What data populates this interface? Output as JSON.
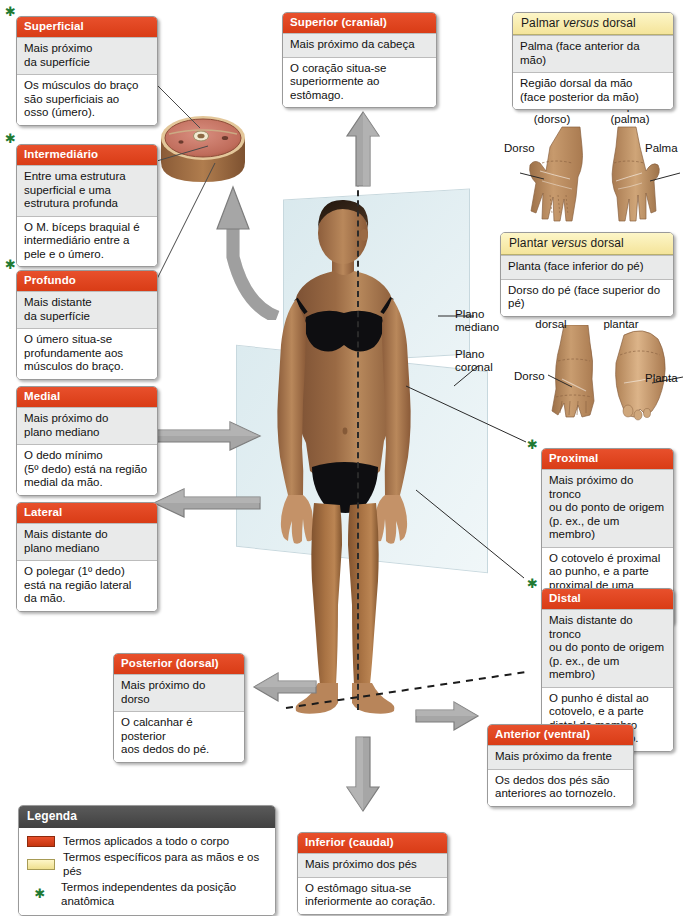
{
  "meta": {
    "colors": {
      "whole_body_term": "#e0431f",
      "hand_foot_term": "#faeeb2",
      "legend_header": "#4d4d4d",
      "star_green": "#1f7a33",
      "plane_blue": "#c4dbe2",
      "arrow_gray": "#9a9a9a"
    }
  },
  "boxes": {
    "superficial": {
      "title": "Superficial",
      "definition": "Mais próximo\nda superfície",
      "example": "Os músculos do braço\nsão superficiais ao\nosso (úmero).",
      "star": true,
      "kind": "whole-body"
    },
    "intermediario": {
      "title": "Intermediário",
      "definition": "Entre uma estrutura\nsuperficial e uma\nestrutura profunda",
      "example": "O M. bíceps braquial é\nintermediário entre a\npele e o úmero.",
      "star": true,
      "kind": "whole-body"
    },
    "profundo": {
      "title": "Profundo",
      "definition": "Mais distante\nda superfície",
      "example": "O úmero situa-se\nprofundamente aos\nmúsculos do braço.",
      "star": true,
      "kind": "whole-body"
    },
    "medial": {
      "title": "Medial",
      "definition": "Mais próximo do\nplano mediano",
      "example": "O dedo mínimo\n(5º dedo) está na região\nmedial da mão.",
      "star": false,
      "kind": "whole-body"
    },
    "lateral": {
      "title": "Lateral",
      "definition": "Mais distante do\nplano mediano",
      "example": "O polegar (1º dedo)\nestá na região lateral\nda mão.",
      "star": false,
      "kind": "whole-body"
    },
    "superior": {
      "title": "Superior (cranial)",
      "definition": "Mais próximo da cabeça",
      "example": "O coração situa-se\nsuperiormente ao estômago.",
      "star": false,
      "kind": "whole-body"
    },
    "inferior": {
      "title": "Inferior (caudal)",
      "definition": "Mais próximo dos pés",
      "example": "O estômago situa-se\ninferiormente ao coração.",
      "star": false,
      "kind": "whole-body"
    },
    "posterior": {
      "title": "Posterior (dorsal)",
      "definition": "Mais próximo do dorso",
      "example": "O calcanhar é posterior\naos dedos do pé.",
      "star": false,
      "kind": "whole-body"
    },
    "anterior": {
      "title": "Anterior (ventral)",
      "definition": "Mais próximo da frente",
      "example": "Os dedos dos pés são\nanteriores ao tornozelo.",
      "star": false,
      "kind": "whole-body"
    },
    "proximal": {
      "title": "Proximal",
      "definition": "Mais próximo do tronco\nou do ponto de origem\n(p. ex., de um membro)",
      "example": "O cotovelo é proximal\nao punho, e a parte\nproximal de uma artéria\né seu início.",
      "star": true,
      "kind": "whole-body"
    },
    "distal": {
      "title": "Distal",
      "definition": "Mais distante do tronco\nou do ponto de origem\n(p. ex., de um membro)",
      "example": "O punho é distal ao\ncotovelo, e a parte\ndistal do membro\nsuperior é a mão.",
      "star": true,
      "kind": "whole-body"
    },
    "palmar": {
      "title_pre": "Palmar ",
      "title_em": "versus",
      "title_post": " dorsal",
      "row1": "Palma (face anterior da mão)",
      "row2": "Região dorsal da mão\n(face posterior da mão)",
      "kind": "hand-foot"
    },
    "plantar": {
      "title_pre": "Plantar ",
      "title_em": "versus",
      "title_post": " dorsal",
      "row1": "Planta (face inferior do pé)",
      "row2": "Dorso do pé (face superior do pé)",
      "kind": "hand-foot"
    }
  },
  "legend": {
    "title": "Legenda",
    "items": [
      {
        "marker": "red-swatch",
        "text": "Termos aplicados a todo o corpo"
      },
      {
        "marker": "yellow-swatch",
        "text": "Termos específicos para as mãos e os pés"
      },
      {
        "marker": "green-star",
        "text": "Termos independentes da posição anatômica"
      }
    ]
  },
  "figure_labels": {
    "plano_mediano": "Plano\nmediano",
    "plano_coronal": "Plano\ncoronal",
    "hand_dorsal_caption": "Face dorsal\n(dorso)",
    "hand_palmar_caption": "Face palmar\n(palma)",
    "hand_dorso": "Dorso",
    "hand_palma": "Palma",
    "foot_dorsal_caption": "Face\ndorsal",
    "foot_plantar_caption": "Face\nplantar",
    "foot_dorso": "Dorso",
    "foot_planta": "Planta"
  }
}
